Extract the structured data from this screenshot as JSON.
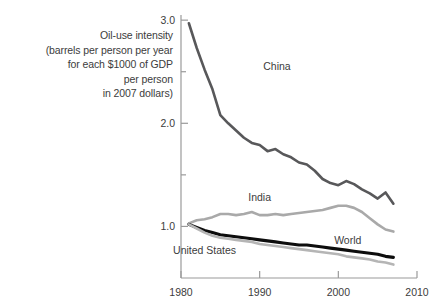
{
  "chart_data": {
    "type": "line",
    "title": "",
    "xlabel": "",
    "ylabel": "Oil-use intensity (barrels per person per year for each $1000 of GDP per person in 2007 dollars)",
    "ylabel_lines": [
      "Oil-use intensity",
      "(barrels per person per year",
      "for each $1000 of GDP",
      "per person",
      "in 2007 dollars)"
    ],
    "xlim": [
      1980,
      2010
    ],
    "ylim": [
      0.5,
      3.05
    ],
    "grid": false,
    "legend_position": "inline-annotations",
    "xticks": [
      1980,
      1990,
      2000,
      2010
    ],
    "xtick_labels": [
      "1980",
      "1990",
      "2000",
      "2010"
    ],
    "yticks": [
      1.0,
      1.5,
      2.0,
      2.5,
      3.0
    ],
    "ytick_labels": [
      "1.0",
      "",
      "2.0",
      "",
      "3.0"
    ],
    "ymajor": [
      1.0,
      2.0,
      3.0
    ],
    "yminor": [
      1.5,
      2.5
    ],
    "series": [
      {
        "name": "China",
        "color": "#58585a",
        "width": 2.6,
        "label_x": 1992.2,
        "label_y": 2.52,
        "x": [
          1981,
          1982,
          1983,
          1984,
          1985,
          1986,
          1987,
          1988,
          1989,
          1990,
          1991,
          1992,
          1993,
          1994,
          1995,
          1996,
          1997,
          1998,
          1999,
          2000,
          2001,
          2002,
          2003,
          2004,
          2005,
          2006,
          2007
        ],
        "values": [
          2.97,
          2.73,
          2.52,
          2.33,
          2.08,
          2.0,
          1.93,
          1.86,
          1.81,
          1.79,
          1.73,
          1.75,
          1.7,
          1.67,
          1.62,
          1.6,
          1.54,
          1.46,
          1.42,
          1.4,
          1.44,
          1.41,
          1.36,
          1.32,
          1.27,
          1.33,
          1.22
        ]
      },
      {
        "name": "India",
        "color": "#a9a9a9",
        "width": 2.6,
        "label_x": 1990.0,
        "label_y": 1.25,
        "x": [
          1981,
          1982,
          1983,
          1984,
          1985,
          1986,
          1987,
          1988,
          1989,
          1990,
          1991,
          1992,
          1993,
          1994,
          1995,
          1996,
          1997,
          1998,
          1999,
          2000,
          2001,
          2002,
          2003,
          2004,
          2005,
          2006,
          2007
        ],
        "values": [
          1.03,
          1.06,
          1.07,
          1.09,
          1.12,
          1.12,
          1.11,
          1.12,
          1.14,
          1.11,
          1.11,
          1.12,
          1.11,
          1.12,
          1.13,
          1.14,
          1.15,
          1.16,
          1.18,
          1.2,
          1.2,
          1.18,
          1.14,
          1.08,
          1.02,
          0.97,
          0.95
        ]
      },
      {
        "name": "World",
        "color": "#0d0d0d",
        "width": 3.1,
        "label_x": 2001.2,
        "label_y": 0.83,
        "x": [
          1981,
          1982,
          1983,
          1984,
          1985,
          1986,
          1987,
          1988,
          1989,
          1990,
          1991,
          1992,
          1993,
          1994,
          1995,
          1996,
          1997,
          1998,
          1999,
          2000,
          2001,
          2002,
          2003,
          2004,
          2005,
          2006,
          2007
        ],
        "values": [
          1.02,
          0.99,
          0.96,
          0.94,
          0.92,
          0.91,
          0.9,
          0.89,
          0.88,
          0.87,
          0.86,
          0.85,
          0.84,
          0.83,
          0.82,
          0.82,
          0.81,
          0.8,
          0.79,
          0.78,
          0.77,
          0.76,
          0.75,
          0.74,
          0.73,
          0.71,
          0.7
        ]
      },
      {
        "name": "United States",
        "color": "#b5b5b5",
        "width": 2.6,
        "label_x": 1983.0,
        "label_y": 0.73,
        "x": [
          1981,
          1982,
          1983,
          1984,
          1985,
          1986,
          1987,
          1988,
          1989,
          1990,
          1991,
          1992,
          1993,
          1994,
          1995,
          1996,
          1997,
          1998,
          1999,
          2000,
          2001,
          2002,
          2003,
          2004,
          2005,
          2006,
          2007
        ],
        "values": [
          1.02,
          0.98,
          0.94,
          0.91,
          0.89,
          0.88,
          0.87,
          0.86,
          0.85,
          0.83,
          0.82,
          0.81,
          0.8,
          0.79,
          0.78,
          0.77,
          0.76,
          0.75,
          0.74,
          0.73,
          0.71,
          0.7,
          0.69,
          0.68,
          0.66,
          0.65,
          0.63
        ]
      }
    ]
  },
  "axis": {
    "color": "#9a9a9a",
    "tick_color": "#9a9a9a"
  }
}
